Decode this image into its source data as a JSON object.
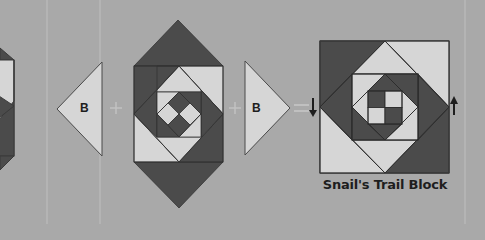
{
  "diagram": {
    "colors": {
      "background": "#a9a9a9",
      "dark": "#4b4b4b",
      "light": "#d6d6d6",
      "outline": "#3a3a3a",
      "guide": "#b9b9b9",
      "operator": "#c4c4c4"
    },
    "left_triangle": {
      "label": "B",
      "orientation": "pointing-left"
    },
    "plus_1": "+",
    "center_unit": {
      "label": "center unit with A triangles top and bottom"
    },
    "plus_2": "+",
    "right_triangle": {
      "label": "B",
      "orientation": "pointing-right"
    },
    "equals": "=",
    "result": {
      "caption": "Snail's Trail Block",
      "left_arrow": "down-arrow",
      "right_arrow": "up-arrow"
    }
  }
}
